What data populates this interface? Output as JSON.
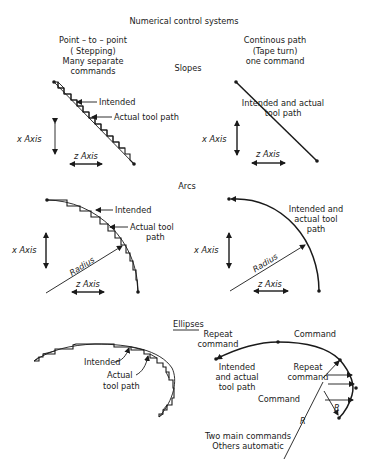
{
  "title": "Numerical control systems",
  "columns": {
    "left": [
      "Point – to – point",
      "( Stepping)",
      "Many separate",
      "commands"
    ],
    "right": [
      "Continous path",
      "(Tape turn)",
      "one command"
    ]
  },
  "sections": {
    "slopes": "Slopes",
    "arcs": "Arcs",
    "ellipses": "Ellipses"
  },
  "labels": {
    "intended": "Intended",
    "actual_tool_path": "Actual tool path",
    "actual_tool": "Actual tool",
    "path": "path",
    "actual": "Actual",
    "tool_path": "tool path",
    "intended_and_actual_1": "Intended and actual",
    "intended_and_actual_2": "tool path",
    "arc_right_1": "Intended and",
    "arc_right_2": "actual tool",
    "arc_right_3": "path",
    "x_axis": "x Axis",
    "z_axis": "z Axis",
    "radius": "Radius",
    "repeat": "Repeat",
    "command": "command",
    "command_cap": "Command",
    "ell_intended_1": "Intended",
    "ell_intended_2": "and actual",
    "ell_intended_3": "tool path",
    "r": "R",
    "two_main_1": "Two main commands",
    "two_main_2": "Others automatic"
  }
}
